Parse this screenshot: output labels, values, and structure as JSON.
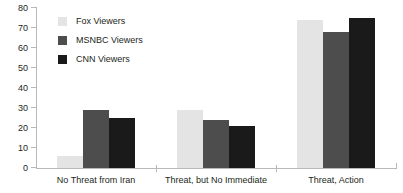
{
  "chart_data": {
    "type": "bar",
    "title": "",
    "xlabel": "",
    "ylabel": "",
    "ylim": [
      0,
      80
    ],
    "ytick_step": 10,
    "yticks": [
      80,
      70,
      60,
      50,
      40,
      30,
      20,
      10,
      0
    ],
    "grid": false,
    "legend_position": "top-left-inside",
    "categories": [
      "No Threat from Iran",
      "Threat, but No Immediate",
      "Threat, Action"
    ],
    "series": [
      {
        "name": "Fox Viewers",
        "color": "#e4e4e4",
        "values": [
          6,
          29,
          74
        ]
      },
      {
        "name": "MSNBC Viewers",
        "color": "#4d4d4d",
        "values": [
          29,
          24,
          68
        ]
      },
      {
        "name": "CNN Viewers",
        "color": "#1a1a1a",
        "values": [
          25,
          21,
          75
        ]
      }
    ]
  },
  "axis": {
    "y_tick_labels": [
      "80",
      "70",
      "60",
      "50",
      "40",
      "30",
      "20",
      "10",
      "0"
    ]
  },
  "legend": {
    "items": [
      {
        "label": "Fox Viewers"
      },
      {
        "label": "MSNBC Viewers"
      },
      {
        "label": "CNN Viewers"
      }
    ]
  }
}
